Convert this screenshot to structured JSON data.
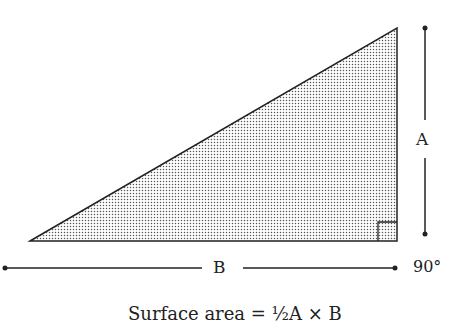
{
  "diagram": {
    "triangle": {
      "points": [
        [
          30,
          241
        ],
        [
          397,
          28
        ],
        [
          397,
          241
        ]
      ],
      "fill_pattern": "stipple-dots",
      "right_angle_corner": "bottom-right"
    },
    "labels": {
      "height": "A",
      "base": "B",
      "angle": "90°"
    },
    "formula": "Surface area = ½A × B"
  }
}
